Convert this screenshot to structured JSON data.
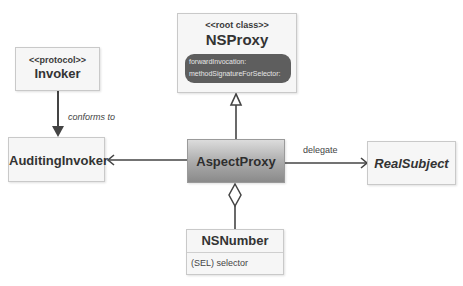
{
  "diagram": {
    "nodes": {
      "nsproxy": {
        "stereotype": "<<root class>>",
        "name": "NSProxy",
        "methods": [
          "forwardInvocation:",
          "methodSignatureForSelector:"
        ]
      },
      "invoker": {
        "stereotype": "<<protocol>>",
        "name": "Invoker"
      },
      "auditing_invoker": {
        "name": "AuditingInvoker"
      },
      "aspect_proxy": {
        "name": "AspectProxy"
      },
      "real_subject": {
        "name": "RealSubject"
      },
      "nsnumber": {
        "name": "NSNumber",
        "attribute": "(SEL) selector"
      }
    },
    "edges": [
      {
        "from": "Invoker",
        "to": "AuditingInvoker",
        "label": "conforms to",
        "type": "filled-arrow"
      },
      {
        "from": "AspectProxy",
        "to": "NSProxy",
        "label": "",
        "type": "inheritance"
      },
      {
        "from": "AspectProxy",
        "to": "AuditingInvoker",
        "label": "",
        "type": "open-arrow"
      },
      {
        "from": "AspectProxy",
        "to": "RealSubject",
        "label": "delegate",
        "type": "open-arrow"
      },
      {
        "from": "NSNumber",
        "to": "AspectProxy",
        "label": "",
        "type": "aggregation"
      }
    ],
    "labels": {
      "conforms_to": "conforms to",
      "delegate": "delegate"
    }
  }
}
